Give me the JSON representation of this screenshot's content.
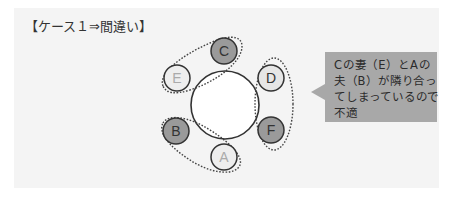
{
  "title": "【ケース１⇒間違い】",
  "diagram": {
    "table": {
      "cx": 225,
      "cy": 105,
      "r": 34,
      "fill": "#ffffff",
      "stroke": "#333333"
    },
    "nodes": [
      {
        "id": "C",
        "label": "C",
        "cx": 224,
        "cy": 51,
        "r": 13,
        "fill": "#9a9a9a",
        "text_color": "#333333"
      },
      {
        "id": "E",
        "label": "E",
        "cx": 177,
        "cy": 78,
        "r": 13,
        "fill": "#eeeeee",
        "text_color": "#aaaaaa"
      },
      {
        "id": "D",
        "label": "D",
        "cx": 271,
        "cy": 78,
        "r": 13,
        "fill": "#e6e6e6",
        "text_color": "#333333"
      },
      {
        "id": "B",
        "label": "B",
        "cx": 176,
        "cy": 131,
        "r": 13,
        "fill": "#9a9a9a",
        "text_color": "#333333"
      },
      {
        "id": "F",
        "label": "F",
        "cx": 271,
        "cy": 130,
        "r": 13,
        "fill": "#9a9a9a",
        "text_color": "#333333"
      },
      {
        "id": "A",
        "label": "A",
        "cx": 224,
        "cy": 157,
        "r": 13,
        "fill": "#eeeeee",
        "text_color": "#aaaaaa"
      }
    ],
    "pairs": [
      {
        "name": "couple-C-E",
        "members": [
          "C",
          "E"
        ]
      },
      {
        "name": "couple-D-F",
        "members": [
          "D",
          "F"
        ]
      },
      {
        "name": "couple-A-B",
        "members": [
          "A",
          "B"
        ]
      }
    ]
  },
  "callout": {
    "lines": [
      "Cの妻（E）とAの",
      "夫（B）が隣り合っ",
      "てしまっているので",
      "不適"
    ],
    "background": "#a8a8a8"
  }
}
